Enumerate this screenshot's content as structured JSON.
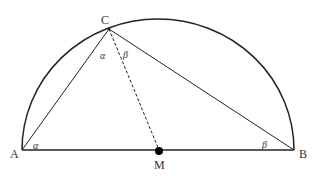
{
  "diagram": {
    "type": "geometry",
    "colors": {
      "stroke": "#222222",
      "label": "#333333",
      "background": "#ffffff"
    },
    "points": {
      "A": {
        "label": "A",
        "x": 22,
        "y": 150
      },
      "B": {
        "label": "B",
        "x": 294,
        "y": 150
      },
      "C": {
        "label": "C",
        "x": 109,
        "y": 29
      },
      "M": {
        "label": "M",
        "x": 159,
        "y": 151
      }
    },
    "segments": [
      {
        "from": "A",
        "to": "B",
        "style": "solid"
      },
      {
        "from": "A",
        "to": "C",
        "style": "solid"
      },
      {
        "from": "C",
        "to": "B",
        "style": "solid"
      },
      {
        "from": "C",
        "to": "M",
        "style": "dashed"
      }
    ],
    "arc": {
      "type": "semicircle",
      "from": "A",
      "to": "B",
      "center": "M"
    },
    "angle_labels": {
      "alpha_at_C": "α",
      "beta_at_C": "β",
      "alpha_at_A": "α",
      "beta_at_B": "β"
    }
  }
}
